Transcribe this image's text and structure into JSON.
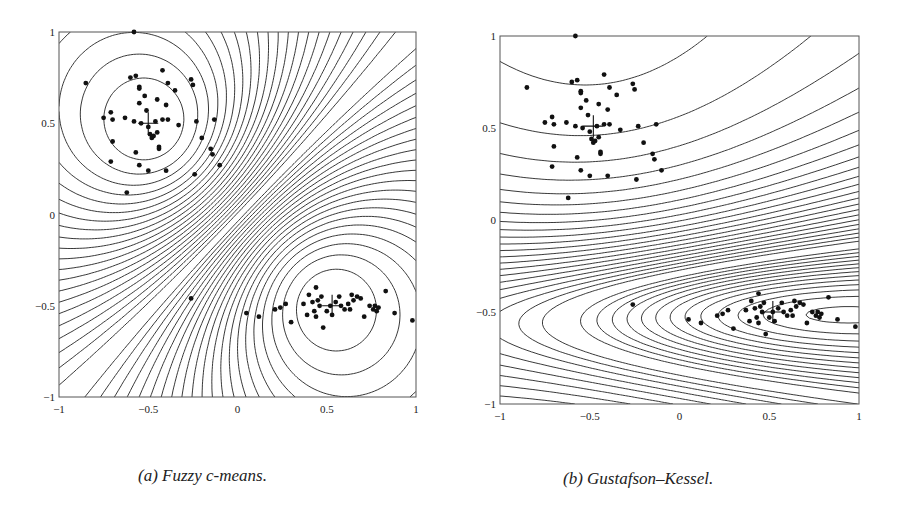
{
  "figure": {
    "captions": [
      "(a) Fuzzy c-means.",
      "(b) Gustafson–Kessel."
    ]
  },
  "chart_data": [
    {
      "type": "scatter",
      "title": "(a) Fuzzy c-means.",
      "subtype": "scatter with membership contour lines",
      "xlabel": "",
      "ylabel": "",
      "xlim": [
        -1,
        1
      ],
      "ylim": [
        -1,
        1
      ],
      "xticks": [
        "-1",
        "-0.5",
        "0",
        "0.5",
        "1"
      ],
      "yticks": [
        "-1",
        "-0.5",
        "0",
        "0.5",
        "1"
      ],
      "grid": false,
      "legend": null,
      "prototypes": [
        {
          "x": -0.5,
          "y": 0.5,
          "marker": "+"
        },
        {
          "x": 0.53,
          "y": -0.5,
          "marker": "+"
        }
      ],
      "decision_boundary": "straight diagonal line through (0,0), slope ~1 (white)",
      "contour_shape": "circular around each prototype",
      "series": [
        {
          "name": "cluster 1",
          "points": [
            [
              -0.58,
              1.0
            ],
            [
              -0.85,
              0.72
            ],
            [
              -0.6,
              0.75
            ],
            [
              -0.57,
              0.76
            ],
            [
              -0.55,
              0.7
            ],
            [
              -0.55,
              0.69
            ],
            [
              -0.42,
              0.79
            ],
            [
              -0.39,
              0.72
            ],
            [
              -0.35,
              0.68
            ],
            [
              -0.26,
              0.74
            ],
            [
              -0.25,
              0.71
            ],
            [
              -0.52,
              0.65
            ],
            [
              -0.45,
              0.63
            ],
            [
              -0.4,
              0.6
            ],
            [
              -0.55,
              0.61
            ],
            [
              -0.51,
              0.57
            ],
            [
              -0.71,
              0.56
            ],
            [
              -0.75,
              0.53
            ],
            [
              -0.7,
              0.52
            ],
            [
              -0.63,
              0.53
            ],
            [
              -0.58,
              0.51
            ],
            [
              -0.54,
              0.5
            ],
            [
              -0.46,
              0.51
            ],
            [
              -0.42,
              0.52
            ],
            [
              -0.39,
              0.52
            ],
            [
              -0.33,
              0.49
            ],
            [
              -0.23,
              0.51
            ],
            [
              -0.13,
              0.52
            ],
            [
              -0.5,
              0.48
            ],
            [
              -0.49,
              0.44
            ],
            [
              -0.48,
              0.42
            ],
            [
              -0.47,
              0.43
            ],
            [
              -0.45,
              0.45
            ],
            [
              -0.44,
              0.37
            ],
            [
              -0.44,
              0.36
            ],
            [
              -0.2,
              0.42
            ],
            [
              -0.15,
              0.36
            ],
            [
              -0.14,
              0.33
            ],
            [
              -0.57,
              0.34
            ],
            [
              -0.7,
              0.4
            ],
            [
              -0.71,
              0.29
            ],
            [
              -0.55,
              0.27
            ],
            [
              -0.5,
              0.24
            ],
            [
              -0.4,
              0.24
            ],
            [
              -0.24,
              0.22
            ],
            [
              -0.1,
              0.27
            ],
            [
              -0.62,
              0.12
            ]
          ]
        },
        {
          "name": "cluster 2",
          "points": [
            [
              -0.26,
              -0.46
            ],
            [
              0.05,
              -0.54
            ],
            [
              0.12,
              -0.56
            ],
            [
              0.21,
              -0.52
            ],
            [
              0.24,
              -0.51
            ],
            [
              0.27,
              -0.49
            ],
            [
              0.3,
              -0.59
            ],
            [
              0.37,
              -0.49
            ],
            [
              0.39,
              -0.55
            ],
            [
              0.4,
              -0.44
            ],
            [
              0.42,
              -0.48
            ],
            [
              0.43,
              -0.53
            ],
            [
              0.44,
              -0.56
            ],
            [
              0.44,
              -0.4
            ],
            [
              0.46,
              -0.5
            ],
            [
              0.47,
              -0.45
            ],
            [
              0.48,
              -0.62
            ],
            [
              0.5,
              -0.53
            ],
            [
              0.52,
              -0.5
            ],
            [
              0.53,
              -0.55
            ],
            [
              0.55,
              -0.48
            ],
            [
              0.57,
              -0.45
            ],
            [
              0.6,
              -0.52
            ],
            [
              0.62,
              -0.49
            ],
            [
              0.64,
              -0.44
            ],
            [
              0.65,
              -0.47
            ],
            [
              0.67,
              -0.45
            ],
            [
              0.69,
              -0.46
            ],
            [
              0.71,
              -0.56
            ],
            [
              0.74,
              -0.5
            ],
            [
              0.76,
              -0.52
            ],
            [
              0.77,
              -0.5
            ],
            [
              0.78,
              -0.53
            ],
            [
              0.79,
              -0.51
            ],
            [
              0.83,
              -0.42
            ],
            [
              0.88,
              -0.54
            ],
            [
              0.98,
              -0.58
            ],
            [
              0.63,
              -0.52
            ],
            [
              0.58,
              -0.5
            ],
            [
              0.45,
              -0.47
            ]
          ]
        }
      ]
    },
    {
      "type": "scatter",
      "title": "(b) Gustafson–Kessel.",
      "subtype": "scatter with membership contour lines",
      "xlabel": "",
      "ylabel": "",
      "xlim": [
        -1,
        1
      ],
      "ylim": [
        -1,
        1
      ],
      "xticks": [
        "-1",
        "-0.5",
        "0",
        "0.5",
        "1"
      ],
      "yticks": [
        "-1",
        "-0.5",
        "0",
        "0.5",
        "1"
      ],
      "grid": false,
      "legend": null,
      "prototypes": [
        {
          "x": -0.48,
          "y": 0.51,
          "marker": "+"
        },
        {
          "x": 0.52,
          "y": -0.5,
          "marker": "+"
        }
      ],
      "decision_boundary": "curved line from (-1,-0.23) through (0,-0.15) to (1,0.05) (white)",
      "contour_shape": "circular around cluster 1, flat horizontal ellipses around cluster 2",
      "series": [
        {
          "name": "cluster 1",
          "points": "same as panel (a) cluster 1"
        },
        {
          "name": "cluster 2",
          "points": "same as panel (a) cluster 2"
        }
      ]
    }
  ],
  "panels": [
    {
      "id": "a",
      "x0": 59,
      "y0": 32,
      "x1": 416,
      "y1": 397,
      "method": "fcm"
    },
    {
      "id": "b",
      "x0": 500,
      "y0": 36,
      "x1": 859,
      "y1": 404,
      "method": "gk"
    }
  ]
}
